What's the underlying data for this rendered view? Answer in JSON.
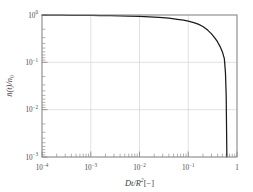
{
  "chart_data": {
    "type": "line",
    "title": "",
    "subtitle": "",
    "xlabel": "Dt/R^2 [-]",
    "xlabel_parts": {
      "main": "Dt/R",
      "exponent": "2",
      "unit": "[−]"
    },
    "ylabel": "n̄(t)/n₀",
    "ylabel_parts": {
      "bar_symbol": "n̄",
      "arg": "(t)/",
      "denom": "n",
      "denom_sub": "0"
    },
    "xscale": "log",
    "yscale": "log",
    "xlim": [
      0.0001,
      1
    ],
    "ylim": [
      0.001,
      1
    ],
    "grid": true,
    "grid_color": "#d0d0d0",
    "legend": null,
    "legend_position": "none",
    "line_color": "#1a1a1a",
    "axis_color": "#808080",
    "background": "#ffffff",
    "xticks": [
      0.0001,
      0.001,
      0.01,
      0.1,
      1
    ],
    "xtick_labels": [
      {
        "mantissa": "10",
        "exponent": "−4"
      },
      {
        "mantissa": "10",
        "exponent": "−3"
      },
      {
        "mantissa": "10",
        "exponent": "−2"
      },
      {
        "mantissa": "10",
        "exponent": "−1"
      },
      {
        "mantissa": "1",
        "exponent": ""
      }
    ],
    "yticks": [
      0.001,
      0.01,
      0.1,
      1
    ],
    "ytick_labels": [
      {
        "mantissa": "10",
        "exponent": "−3"
      },
      {
        "mantissa": "10",
        "exponent": "−2"
      },
      {
        "mantissa": "10",
        "exponent": "−1"
      },
      {
        "mantissa": "10",
        "exponent": "0"
      }
    ],
    "series": [
      {
        "name": "mean concentration decay",
        "x": [
          0.0001,
          0.00015,
          0.00025,
          0.0004,
          0.0006,
          0.001,
          0.0016,
          0.0025,
          0.004,
          0.006,
          0.01,
          0.016,
          0.025,
          0.04,
          0.06,
          0.08,
          0.1,
          0.13,
          0.16,
          0.2,
          0.25,
          0.3,
          0.35,
          0.4,
          0.45,
          0.5,
          0.55,
          0.58,
          0.6,
          0.62
        ],
        "y": [
          0.993,
          0.991,
          0.989,
          0.986,
          0.983,
          0.978,
          0.972,
          0.965,
          0.956,
          0.947,
          0.933,
          0.916,
          0.893,
          0.856,
          0.812,
          0.776,
          0.742,
          0.69,
          0.64,
          0.57,
          0.48,
          0.4,
          0.33,
          0.27,
          0.215,
          0.168,
          0.12,
          0.06,
          0.02,
          0.001
        ]
      }
    ]
  },
  "figure": {
    "width": 253,
    "height": 192
  }
}
